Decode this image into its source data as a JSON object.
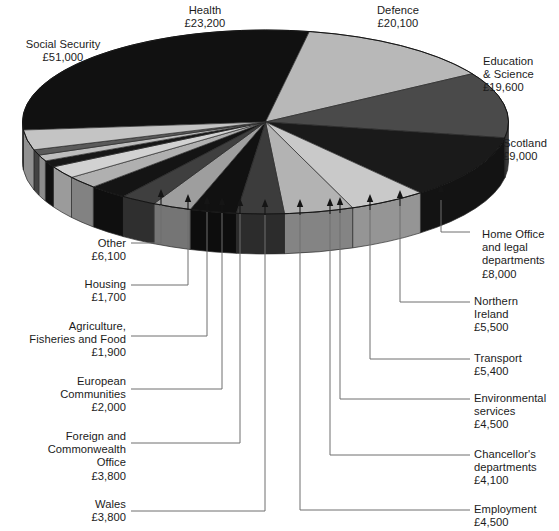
{
  "figure": {
    "type": "pie-3d",
    "currency_symbol": "£",
    "units": "millions",
    "background": "#ffffff",
    "text_color": "#1b1b1b",
    "leader_line_color": "#6b6b6b"
  },
  "chart_data": {
    "type": "pie",
    "title": "",
    "subtitle": "",
    "xlabel": "",
    "ylabel": "",
    "legend_position": "callout-labels",
    "grid": false,
    "total": 170200,
    "categories": [
      "Social Security",
      "Health",
      "Defence",
      "Education & Science",
      "Scotland",
      "Home Office and legal departments",
      "Northern Ireland",
      "Transport",
      "Environmental services",
      "Chancellor's departments",
      "Employment",
      "Wales",
      "Foreign and Commonwealth Office",
      "European Communities",
      "Agriculture, Fisheries and Food",
      "Housing",
      "Other"
    ],
    "values": [
      51000,
      23200,
      20100,
      19600,
      9000,
      8000,
      5500,
      5400,
      4500,
      4100,
      4500,
      3800,
      3800,
      2000,
      1900,
      1700,
      6100
    ],
    "value_labels": [
      "£51,000",
      "£23,200",
      "£20,100",
      "£19,600",
      "£9,000",
      "£8,000",
      "£5,500",
      "£5,400",
      "£4,500",
      "£4,100",
      "£4,500",
      "£3,800",
      "£3,800",
      "£2,000",
      "£1,900",
      "£1,700",
      "£6,100"
    ],
    "slice_fills": [
      "#111111",
      "#b8b8b8",
      "#4a4a4a",
      "#1a1a1a",
      "#c9c9c9",
      "#b3b3b3",
      "#3c3c3c",
      "#111111",
      "#9e9e9e",
      "#3f3f3f",
      "#141414",
      "#b0b0b0",
      "#d2d2d2",
      "#171717",
      "#bdbdbd",
      "#5a5a5a",
      "#c4c4c4"
    ]
  },
  "callouts": {
    "top": [
      {
        "name": "health",
        "label": "Health",
        "value": "£23,200",
        "text": "Health\n£23,200"
      },
      {
        "name": "defence",
        "label": "Defence",
        "value": "£20,100",
        "text": "Defence\n£20,100"
      }
    ],
    "left": [
      {
        "name": "social-security",
        "label": "Social Security",
        "value": "£51,000",
        "text": "Social Security\n£51,000"
      },
      {
        "name": "other",
        "label": "Other",
        "value": "£6,100",
        "text": "Other\n£6,100"
      },
      {
        "name": "housing",
        "label": "Housing",
        "value": "£1,700",
        "text": "Housing\n£1,700"
      },
      {
        "name": "agriculture-fisheries-food",
        "label": "Agriculture, Fisheries and Food",
        "value": "£1,900",
        "text": "Agriculture,\nFisheries and Food\n£1,900"
      },
      {
        "name": "european-communities",
        "label": "European Communities",
        "value": "£2,000",
        "text": "European\nCommunities\n£2,000"
      },
      {
        "name": "foreign-commonwealth-office",
        "label": "Foreign and Commonwealth Office",
        "value": "£3,800",
        "text": "Foreign and\nCommonwealth\nOffice\n£3,800"
      },
      {
        "name": "wales",
        "label": "Wales",
        "value": "£3,800",
        "text": "Wales\n£3,800"
      }
    ],
    "right": [
      {
        "name": "education-science",
        "label": "Education & Science",
        "value": "£19,600",
        "text": "Education\n& Science\n£19,600"
      },
      {
        "name": "scotland",
        "label": "Scotland",
        "value": "£9,000",
        "text": "Scotland\n£9,000"
      },
      {
        "name": "home-office-legal",
        "label": "Home Office and legal departments",
        "value": "£8,000",
        "text": "Home Office\nand legal\ndepartments\n£8,000"
      },
      {
        "name": "northern-ireland",
        "label": "Northern Ireland",
        "value": "£5,500",
        "text": "Northern\nIreland\n£5,500"
      },
      {
        "name": "transport",
        "label": "Transport",
        "value": "£5,400",
        "text": "Transport\n£5,400"
      },
      {
        "name": "environmental-services",
        "label": "Environmental services",
        "value": "£4,500",
        "text": "Environmental\nservices\n£4,500"
      },
      {
        "name": "chancellors-departments",
        "label": "Chancellor's departments",
        "value": "£4,100",
        "text": "Chancellor's\ndepartments\n£4,100"
      },
      {
        "name": "employment",
        "label": "Employment",
        "value": "£4,500",
        "text": "Employment\n£4,500"
      }
    ]
  }
}
